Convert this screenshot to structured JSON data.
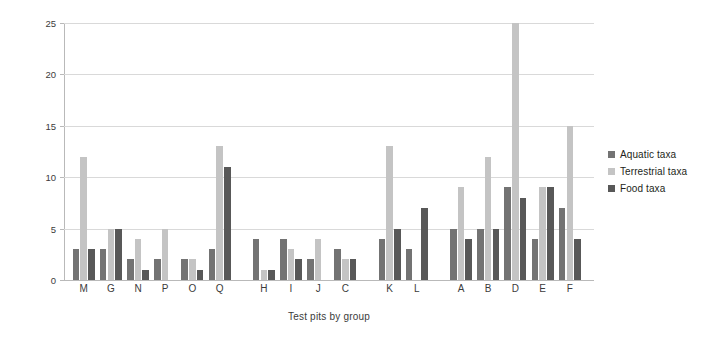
{
  "chart_data": {
    "type": "bar",
    "title": "",
    "xlabel": "Test pits by group",
    "ylabel": "Number of taxa",
    "ylim": [
      0,
      25
    ],
    "yticks": [
      0,
      5,
      10,
      15,
      20,
      25
    ],
    "grid": true,
    "legend_position": "right",
    "categories": [
      "M",
      "G",
      "N",
      "P",
      "O",
      "Q",
      "H",
      "I",
      "J",
      "C",
      "K",
      "L",
      "A",
      "B",
      "D",
      "E",
      "F"
    ],
    "group_breaks_after": [
      "Q",
      "C",
      "L"
    ],
    "series": [
      {
        "name": "Aquatic taxa",
        "color": "#737373",
        "values": [
          3,
          3,
          2,
          2,
          2,
          3,
          4,
          4,
          2,
          3,
          4,
          3,
          5,
          5,
          9,
          4,
          7
        ]
      },
      {
        "name": "Terrestrial taxa",
        "color": "#c4c4c4",
        "values": [
          12,
          5,
          4,
          5,
          2,
          13,
          1,
          3,
          4,
          2,
          13,
          0,
          9,
          12,
          25,
          9,
          15
        ]
      },
      {
        "name": "Food taxa",
        "color": "#585858",
        "values": [
          3,
          5,
          1,
          0,
          1,
          11,
          1,
          2,
          0,
          2,
          5,
          7,
          4,
          5,
          8,
          9,
          4
        ]
      }
    ]
  },
  "axes": {
    "y_title": "Number of taxa",
    "x_title": "Test pits by group",
    "y_tick_labels": [
      "0",
      "5",
      "10",
      "15",
      "20",
      "25"
    ]
  },
  "legend": {
    "items": [
      {
        "label": "Aquatic taxa",
        "color": "#737373"
      },
      {
        "label": "Terrestrial taxa",
        "color": "#c4c4c4"
      },
      {
        "label": "Food taxa",
        "color": "#585858"
      }
    ]
  }
}
